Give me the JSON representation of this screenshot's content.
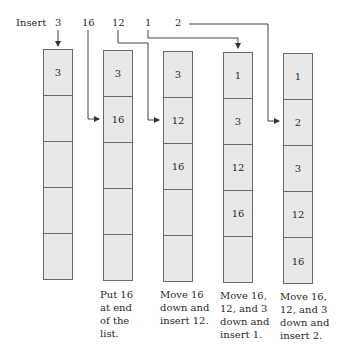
{
  "header": {
    "insert_label": "Insert",
    "values": [
      "3",
      "16",
      "12",
      "1",
      "2"
    ]
  },
  "columns": [
    {
      "cells": [
        "3",
        "",
        "",
        "",
        ""
      ],
      "caption": ""
    },
    {
      "cells": [
        "3",
        "16",
        "",
        "",
        ""
      ],
      "caption": "Put 16\nat end\nof the\nlist."
    },
    {
      "cells": [
        "3",
        "12",
        "16",
        "",
        ""
      ],
      "caption": "Move 16\ndown and\ninsert 12."
    },
    {
      "cells": [
        "1",
        "3",
        "12",
        "16",
        ""
      ],
      "caption": "Move 16,\n12, and 3\ndown and\ninsert 1."
    },
    {
      "cells": [
        "1",
        "2",
        "3",
        "12",
        "16"
      ],
      "caption": "Move 16,\n12, and 3\ndown and\ninsert 2."
    }
  ],
  "colors": {
    "cell_fill": "#e8e8e8",
    "line": "#4a4a4a"
  }
}
